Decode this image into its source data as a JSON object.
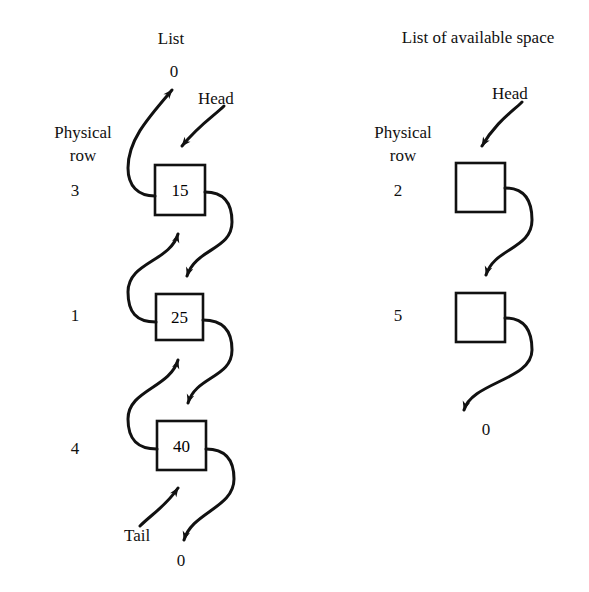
{
  "figure": {
    "background": "#ffffff",
    "ink": "#111111",
    "lists": [
      {
        "name": "list",
        "title": "List",
        "title_pos": {
          "x": 143,
          "y": 30,
          "w": 56
        },
        "group_label_line1": "Physical",
        "group_label_line2": "row",
        "group_label_pos": {
          "x": 28,
          "y": 124,
          "w": 110
        },
        "head_label": "Head",
        "head_label_pos": {
          "x": 198,
          "y": 90
        },
        "tail_label": "Tail",
        "tail_label_pos": {
          "x": 124,
          "y": 527
        },
        "head_null": "0",
        "head_null_pos": {
          "x": 167,
          "y": 63,
          "w": 14
        },
        "tail_null": "0",
        "tail_null_pos": {
          "x": 174,
          "y": 552,
          "w": 14
        },
        "nodes": [
          {
            "value": "15",
            "row": "3",
            "box": {
              "x": 155,
              "y": 165,
              "w": 50,
              "h": 50
            },
            "row_pos": {
              "x": 55,
              "y": 182,
              "w": 40
            }
          },
          {
            "value": "25",
            "row": "1",
            "box": {
              "x": 156,
              "y": 294,
              "w": 47,
              "h": 46
            },
            "row_pos": {
              "x": 55,
              "y": 307,
              "w": 40
            }
          },
          {
            "value": "40",
            "row": "4",
            "box": {
              "x": 157,
              "y": 421,
              "w": 49,
              "h": 49
            },
            "row_pos": {
              "x": 55,
              "y": 440,
              "w": 40
            }
          }
        ]
      },
      {
        "name": "available-space-list",
        "title": "List of available space",
        "title_pos": {
          "x": 378,
          "y": 29,
          "w": 200
        },
        "group_label_line1": "Physical",
        "group_label_line2": "row",
        "group_label_pos": {
          "x": 348,
          "y": 124,
          "w": 110
        },
        "head_label": "Head",
        "head_label_pos": {
          "x": 492,
          "y": 85
        },
        "tail_null": "0",
        "tail_null_pos": {
          "x": 479,
          "y": 421,
          "w": 14
        },
        "nodes": [
          {
            "value": "",
            "row": "2",
            "box": {
              "x": 456,
              "y": 163,
              "w": 49,
              "h": 49
            },
            "row_pos": {
              "x": 378,
              "y": 182,
              "w": 40
            }
          },
          {
            "value": "",
            "row": "5",
            "box": {
              "x": 456,
              "y": 293,
              "w": 49,
              "h": 49
            },
            "row_pos": {
              "x": 378,
              "y": 307,
              "w": 40
            }
          }
        ]
      }
    ]
  }
}
